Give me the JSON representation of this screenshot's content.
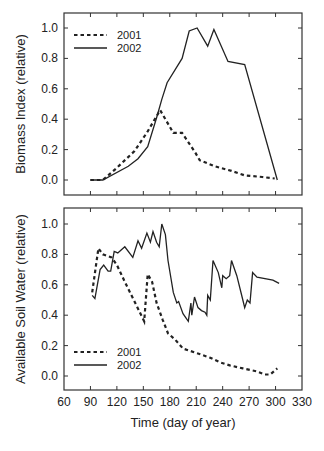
{
  "chart_data": [
    {
      "type": "line",
      "title": "",
      "xlabel": "",
      "ylabel": "Biomass Index (relative)",
      "xlim": [
        60,
        330
      ],
      "ylim": [
        -0.1,
        1.1
      ],
      "xticks": [
        90,
        120,
        150,
        180,
        210,
        240,
        270,
        300
      ],
      "yticks": [
        "0.0",
        "0.2",
        "0.4",
        "0.6",
        "0.8",
        "1.0"
      ],
      "legend_position": "upper left",
      "series": [
        {
          "name": "2001",
          "style": "dashed",
          "x": [
            90,
            104,
            120,
            140,
            155,
            169,
            184,
            194,
            209,
            214,
            231,
            250,
            265,
            285,
            299
          ],
          "y": [
            0.0,
            0.0,
            0.08,
            0.19,
            0.32,
            0.46,
            0.31,
            0.31,
            0.18,
            0.13,
            0.09,
            0.06,
            0.03,
            0.02,
            0.01
          ]
        },
        {
          "name": "2002",
          "style": "solid",
          "x": [
            90,
            104,
            133,
            144,
            155,
            165,
            171,
            177,
            194,
            202,
            211,
            223,
            230,
            246,
            265,
            302
          ],
          "y": [
            0.0,
            0.0,
            0.09,
            0.14,
            0.22,
            0.41,
            0.53,
            0.64,
            0.8,
            0.98,
            1.0,
            0.88,
            0.99,
            0.78,
            0.76,
            0.0
          ]
        }
      ]
    },
    {
      "type": "line",
      "title": "",
      "xlabel": "Time (day of year)",
      "ylabel": "Available Soil Water (relative)",
      "xlim": [
        60,
        330
      ],
      "ylim": [
        -0.1,
        1.1
      ],
      "xticks": [
        60,
        90,
        120,
        150,
        180,
        210,
        240,
        270,
        300,
        330
      ],
      "yticks": [
        "0.0",
        "0.2",
        "0.4",
        "0.6",
        "0.8",
        "1.0"
      ],
      "legend_position": "lower left",
      "series": [
        {
          "name": "2001",
          "style": "dashed",
          "x": [
            92,
            99,
            104,
            114,
            120,
            129,
            140,
            151,
            155,
            160,
            165,
            172,
            178,
            186,
            195,
            211,
            226,
            237,
            248,
            263,
            279,
            288,
            294,
            302
          ],
          "y": [
            0.55,
            0.84,
            0.8,
            0.78,
            0.73,
            0.62,
            0.49,
            0.36,
            0.67,
            0.62,
            0.48,
            0.37,
            0.28,
            0.24,
            0.18,
            0.15,
            0.12,
            0.09,
            0.07,
            0.05,
            0.03,
            0.01,
            0.01,
            0.05
          ]
        },
        {
          "name": "2002",
          "style": "solid",
          "x": [
            92,
            95,
            101,
            105,
            110,
            113,
            117,
            121,
            129,
            138,
            144,
            148,
            154,
            158,
            161,
            165,
            168,
            171,
            175,
            178,
            184,
            188,
            190,
            195,
            201,
            204,
            205,
            208,
            212,
            216,
            220,
            222,
            223,
            226,
            229,
            235,
            239,
            240,
            244,
            248,
            250,
            256,
            262,
            265,
            268,
            271,
            274,
            279,
            297,
            304
          ],
          "y": [
            0.53,
            0.51,
            0.7,
            0.73,
            0.69,
            0.69,
            0.82,
            0.81,
            0.85,
            0.78,
            0.89,
            0.84,
            0.94,
            0.88,
            0.95,
            0.88,
            0.85,
            1.0,
            0.93,
            0.76,
            0.55,
            0.48,
            0.49,
            0.41,
            0.36,
            0.48,
            0.4,
            0.52,
            0.45,
            0.43,
            0.42,
            0.4,
            0.53,
            0.5,
            0.76,
            0.68,
            0.58,
            0.66,
            0.64,
            0.66,
            0.76,
            0.66,
            0.52,
            0.45,
            0.5,
            0.48,
            0.68,
            0.65,
            0.63,
            0.61
          ]
        }
      ]
    }
  ],
  "legend": {
    "label_2001": "2001",
    "label_2002": "2002"
  },
  "axes": {
    "top_ylabel": "Biomass Index (relative)",
    "bottom_ylabel": "Available Soil Water (relative)",
    "xlabel": "Time (day of year)"
  }
}
